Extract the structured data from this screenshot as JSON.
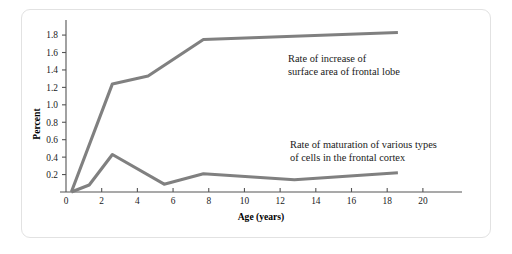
{
  "figure": {
    "background_color": "#ffffff",
    "border_color": "#e2e2e2",
    "line_color": "#808080",
    "axis_color": "#555555",
    "text_color": "#1a1a1a"
  },
  "chart_data": {
    "type": "line",
    "title": "",
    "xlabel": "Age (years)",
    "ylabel": "Percent",
    "xlim": [
      0,
      21.8
    ],
    "ylim": [
      0,
      1.95
    ],
    "grid": false,
    "legend_position": "inline-annotation",
    "xticks": [
      0,
      2,
      4,
      6,
      8,
      10,
      12,
      14,
      16,
      18,
      20
    ],
    "xticklabels": [
      "0",
      "2",
      "4",
      "6",
      "8",
      "10",
      "12",
      "14",
      "16",
      "18",
      "20"
    ],
    "yticks": [
      0.2,
      0.4,
      0.6,
      0.8,
      1.0,
      1.2,
      1.4,
      1.6,
      1.8
    ],
    "yticklabels": [
      "0.2",
      "0.4",
      "0.6",
      "0.8",
      "1.0",
      "1.2",
      "1.4",
      "1.6",
      "1.8"
    ],
    "series": [
      {
        "name": "Rate of increase of surface area of frontal lobe",
        "color": "#808080",
        "x": [
          0.3,
          2.6,
          4.6,
          7.7,
          18.6
        ],
        "y": [
          0.0,
          1.24,
          1.33,
          1.75,
          1.83
        ]
      },
      {
        "name": "Rate of maturation of various types of cells in the frontal cortex",
        "color": "#808080",
        "x": [
          0.3,
          1.3,
          2.6,
          5.5,
          7.7,
          12.8,
          18.6
        ],
        "y": [
          0.0,
          0.08,
          0.43,
          0.09,
          0.21,
          0.14,
          0.22
        ]
      }
    ],
    "annotations": [
      {
        "name": "upper-curve-annotation",
        "line1": "Rate of increase of",
        "line2": "surface area of frontal lobe",
        "x_px": 288,
        "y_px": 60
      },
      {
        "name": "lower-curve-annotation",
        "line1": "Rate of maturation of various types",
        "line2": "of cells in the frontal cortex",
        "x_px": 290,
        "y_px": 146
      }
    ]
  }
}
